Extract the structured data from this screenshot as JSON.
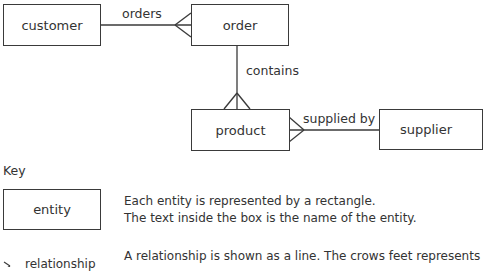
{
  "diagram": {
    "entities": {
      "customer": "customer",
      "order": "order",
      "product": "product",
      "supplier": "supplier"
    },
    "relationships": {
      "customer_order": "orders",
      "order_product": "contains",
      "product_supplier": "supplied by"
    }
  },
  "key": {
    "title": "Key",
    "entity_label": "entity",
    "entity_desc_line1": "Each entity is represented by a rectangle.",
    "entity_desc_line2": "The text inside the box is the name of the entity.",
    "relationship_label": "relationship",
    "relationship_desc_line1": "A relationship is shown as a line. The crows feet represents"
  },
  "colors": {
    "line": "#3a3a3a",
    "text": "#333333",
    "background": "#ffffff"
  }
}
